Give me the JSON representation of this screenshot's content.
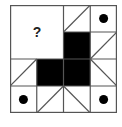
{
  "puzzle": {
    "question_mark": "?",
    "grid_size": 4,
    "colors": {
      "line": "#555555",
      "fill": "#000000",
      "background": "#ffffff"
    },
    "cells": [
      {
        "row": 0,
        "col": 0,
        "span": 2,
        "content": "question"
      },
      {
        "row": 0,
        "col": 2,
        "content": "diagonal-up"
      },
      {
        "row": 0,
        "col": 3,
        "content": "dot"
      },
      {
        "row": 1,
        "col": 2,
        "content": "black"
      },
      {
        "row": 1,
        "col": 3,
        "content": "diagonal-up"
      },
      {
        "row": 2,
        "col": 0,
        "content": "diagonal-up"
      },
      {
        "row": 2,
        "col": 1,
        "content": "black"
      },
      {
        "row": 2,
        "col": 2,
        "content": "black"
      },
      {
        "row": 2,
        "col": 3,
        "content": "diagonal-down"
      },
      {
        "row": 3,
        "col": 0,
        "content": "dot"
      },
      {
        "row": 3,
        "col": 1,
        "content": "diagonal-up"
      },
      {
        "row": 3,
        "col": 2,
        "content": "diagonal-down"
      },
      {
        "row": 3,
        "col": 3,
        "content": "dot"
      }
    ]
  }
}
